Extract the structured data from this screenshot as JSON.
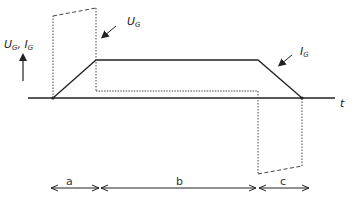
{
  "diagram": {
    "y_axis_label": "U",
    "y_axis_label_sub": "G",
    "y_axis_label_sep": ", ",
    "y_axis_label2": "I",
    "y_axis_label2_sub": "G",
    "x_axis_label": "t",
    "curves": {
      "gate_voltage": {
        "label": "U",
        "sub": "G",
        "style": "dashed/dotted"
      },
      "gate_current": {
        "label": "I",
        "sub": "G",
        "style": "solid"
      }
    },
    "intervals": [
      {
        "label": "a"
      },
      {
        "label": "b"
      },
      {
        "label": "c"
      }
    ],
    "colors": {
      "line": "#222222",
      "dashed": "#444444",
      "background": "#ffffff"
    }
  }
}
